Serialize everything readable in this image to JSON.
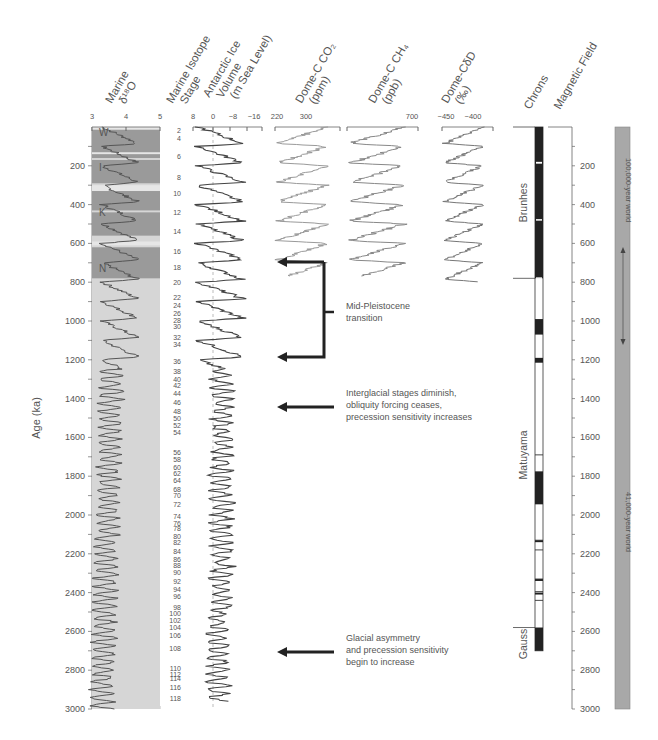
{
  "figure": {
    "y_axis_label": "Age (ka)",
    "age_range": [
      0,
      3000
    ],
    "age_ticks": [
      200,
      400,
      600,
      800,
      1000,
      1200,
      1400,
      1600,
      1800,
      2000,
      2200,
      2400,
      2600,
      2800,
      3000
    ],
    "columns": [
      {
        "id": "d18o",
        "title_lines": [
          "Marine",
          "δ¹⁸O"
        ],
        "ticks": [
          "3",
          "4",
          "5"
        ]
      },
      {
        "id": "mis",
        "title_lines": [
          "Marine Isotope",
          "Stage"
        ]
      },
      {
        "id": "ice",
        "title_lines": [
          "Antarctic Ice",
          "Volume",
          "(m Sea Level)"
        ],
        "ticks": [
          "8",
          "0",
          "−8",
          "−16"
        ]
      },
      {
        "id": "co2",
        "title_lines": [
          "Dome-C CO₂",
          "(ppm)"
        ],
        "ticks": [
          "220",
          "300"
        ]
      },
      {
        "id": "ch4",
        "title_lines": [
          "Dome-C CH₄",
          "(ppb)"
        ],
        "ticks": [
          "700"
        ]
      },
      {
        "id": "dd",
        "title_lines": [
          "Dome-CδD",
          "(‰)"
        ],
        "ticks": [
          "−450",
          "−400"
        ]
      },
      {
        "id": "chrons",
        "title_lines": [
          "Chrons"
        ]
      },
      {
        "id": "mag",
        "title_lines": [
          "Magnetic Field"
        ]
      }
    ],
    "interglacial_labels": [
      "W",
      "I",
      "K",
      "N"
    ],
    "mis_stages": [
      "2",
      "4",
      "6",
      "8",
      "10",
      "12",
      "14",
      "16",
      "18",
      "20",
      "22",
      "24",
      "26",
      "28",
      "30",
      "32",
      "34",
      "36",
      "38",
      "40",
      "42",
      "44",
      "46",
      "48",
      "50",
      "52",
      "54",
      "56",
      "58",
      "60",
      "62",
      "64",
      "68",
      "70",
      "72",
      "74",
      "76",
      "78",
      "80",
      "82",
      "84",
      "86",
      "88",
      "90",
      "92",
      "94",
      "96",
      "98",
      "100",
      "102",
      "104",
      "106",
      "108",
      "110",
      "112",
      "114",
      "116",
      "118"
    ],
    "chrons": [
      "Brunhes",
      "Matuyama",
      "Gauss"
    ],
    "annotations": [
      {
        "id": "mpt",
        "lines": [
          "Mid-Pleistocene",
          "transition"
        ]
      },
      {
        "id": "interglacial",
        "lines": [
          "Interglacial stages diminish,",
          "obliquity forcing ceases,",
          "precession sensitivity increases"
        ]
      },
      {
        "id": "glacial",
        "lines": [
          "Glacial asymmetry",
          "and precession sensitivity",
          "begin to increase"
        ]
      }
    ],
    "world_bar": {
      "upper": "100,000-year world",
      "lower": "41,000-year world"
    }
  },
  "chart_data": {
    "type": "line",
    "title": "",
    "ylabel": "Age (ka)",
    "ylim": [
      0,
      3000
    ],
    "orientation": "vertical stratigraphic panels",
    "series": [
      {
        "name": "Marine δ18O (‰)",
        "xlim": [
          3,
          5
        ],
        "age_range": [
          0,
          3000
        ]
      },
      {
        "name": "Antarctic Ice Volume (m Sea Level)",
        "xlim": [
          8,
          -16
        ],
        "age_range": [
          0,
          3000
        ]
      },
      {
        "name": "Dome-C CO2 (ppm)",
        "xlim": [
          220,
          300
        ],
        "age_range": [
          0,
          800
        ]
      },
      {
        "name": "Dome-C CH4 (ppb)",
        "xlim": [
          350,
          700
        ],
        "age_range": [
          0,
          800
        ]
      },
      {
        "name": "Dome-C δD (‰)",
        "xlim": [
          -450,
          -400
        ],
        "age_range": [
          0,
          800
        ]
      }
    ],
    "magnetic_polarity_normal_intervals_ka": [
      [
        0,
        780
      ],
      [
        990,
        1070
      ],
      [
        1190,
        1215
      ],
      [
        1775,
        1945
      ],
      [
        2130,
        2140
      ],
      [
        2330,
        2340
      ],
      [
        2400,
        2410
      ],
      [
        2580,
        2700
      ]
    ],
    "chron_boundaries_ka": {
      "Brunhes/Matuyama": 780,
      "Matuyama/Gauss": 2580
    },
    "mis_stage_ages_ka": {
      "2": 20,
      "4": 60,
      "6": 150,
      "8": 260,
      "10": 345,
      "12": 440,
      "14": 540,
      "16": 640,
      "18": 725,
      "20": 800,
      "22": 880,
      "24": 920,
      "26": 960,
      "28": 995,
      "30": 1030,
      "32": 1085,
      "34": 1120,
      "36": 1210,
      "38": 1260,
      "40": 1300,
      "42": 1335,
      "44": 1375,
      "46": 1420,
      "48": 1465,
      "50": 1500,
      "52": 1540,
      "54": 1575,
      "56": 1680,
      "58": 1715,
      "60": 1755,
      "62": 1785,
      "64": 1820,
      "68": 1870,
      "70": 1900,
      "72": 1945,
      "74": 2010,
      "76": 2045,
      "78": 2070,
      "80": 2110,
      "82": 2140,
      "84": 2190,
      "86": 2230,
      "88": 2260,
      "90": 2295,
      "92": 2345,
      "94": 2385,
      "96": 2420,
      "98": 2475,
      "100": 2510,
      "102": 2545,
      "104": 2580,
      "106": 2620,
      "108": 2690,
      "110": 2790,
      "112": 2820,
      "114": 2845,
      "116": 2890,
      "118": 2945
    },
    "annotations_ka": {
      "mid_pleistocene_transition": [
        700,
        1250
      ],
      "interglacial_stages_diminish": 1450,
      "glacial_asymmetry_begins": 2700
    },
    "regimes": [
      {
        "name": "100,000-year world",
        "range_ka": [
          0,
          1250
        ]
      },
      {
        "name": "41,000-year world",
        "range_ka": [
          1250,
          3000
        ]
      }
    ]
  }
}
